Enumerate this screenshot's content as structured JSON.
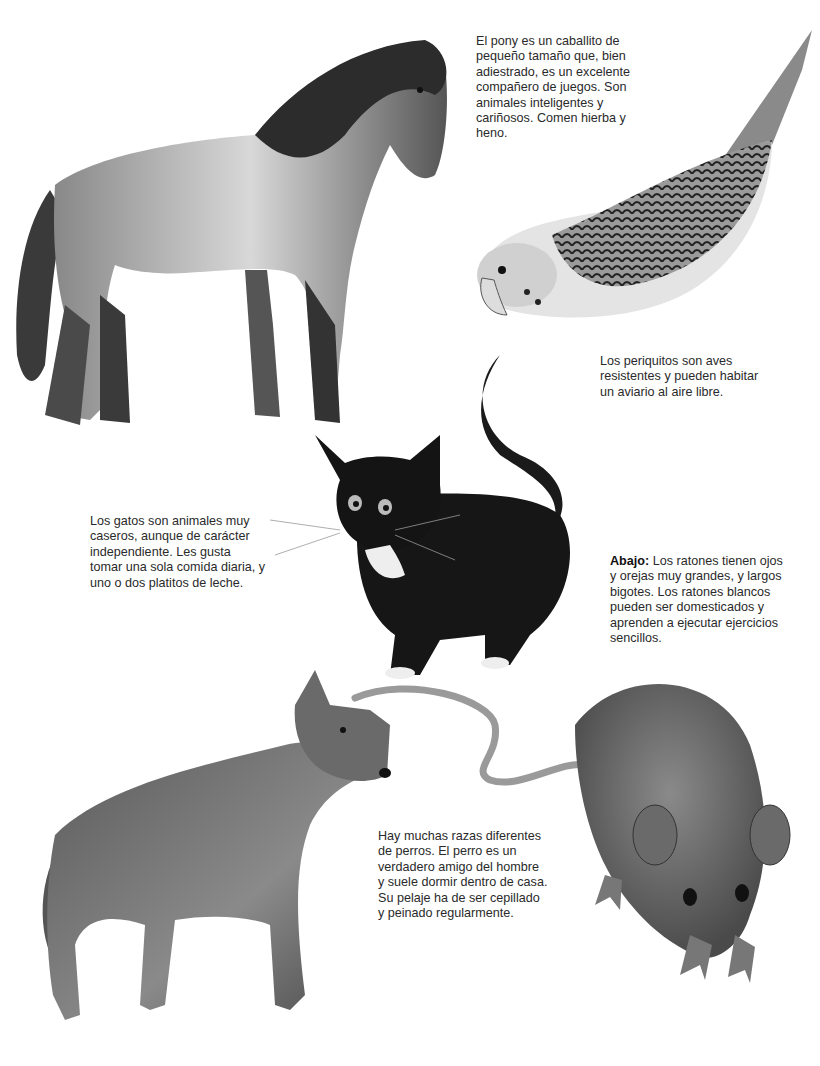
{
  "page": {
    "background": "#ffffff",
    "ink_color": "#2a2a2a"
  },
  "illustrations": [
    {
      "id": "pony",
      "subject": "pony-illustration"
    },
    {
      "id": "parakeet",
      "subject": "parakeet-illustration"
    },
    {
      "id": "cat",
      "subject": "black-white-kitten-illustration"
    },
    {
      "id": "dog",
      "subject": "dog-illustration"
    },
    {
      "id": "mouse",
      "subject": "mouse-illustration"
    }
  ],
  "captions": {
    "pony": "El pony es un caballito de pequeño tamaño que, bien adiestrado, es un excelente compañero de juegos. Son animales inteligentes y cariñosos. Comen hierba y heno.",
    "parakeet": "Los periquitos son aves resistentes y pueden habitar un aviario al aire libre.",
    "cat": "Los gatos son animales muy caseros, aunque de carácter independiente. Les gusta tomar una sola comida diaria, y uno o dos platitos de leche.",
    "mouse_lead": "Abajo:",
    "mouse": "Los ratones tienen ojos y orejas muy grandes, y largos bigotes. Los ratones blancos pueden ser domesticados y aprenden a ejecutar ejercicios sencillos.",
    "dog": "Hay muchas razas diferentes de perros. El perro es un verdadero amigo del hombre y suele dormir dentro de casa. Su pelaje ha de ser cepillado y peinado regularmente."
  }
}
